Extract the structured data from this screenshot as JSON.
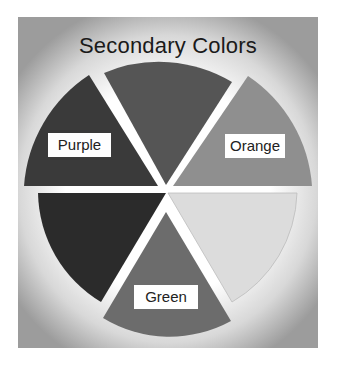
{
  "title": "Secondary Colors",
  "wedges": [
    {
      "name": "purple",
      "label": "Purple",
      "fill": "#3a3a3a"
    },
    {
      "name": "red",
      "label": "",
      "fill": "#555555"
    },
    {
      "name": "orange",
      "label": "Orange",
      "fill": "#8f8f8f"
    },
    {
      "name": "yellow",
      "label": "",
      "fill": "#dcdcdc"
    },
    {
      "name": "green",
      "label": "Green",
      "fill": "#6c6c6c"
    },
    {
      "name": "blue",
      "label": "",
      "fill": "#2b2b2b"
    }
  ],
  "labels": {
    "purple": "Purple",
    "orange": "Orange",
    "green": "Green"
  }
}
